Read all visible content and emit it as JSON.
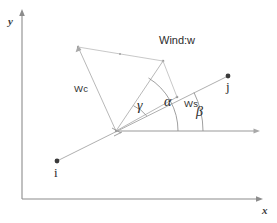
{
  "figure": {
    "kind": "vector-decomposition-diagram",
    "background_color": "#ffffff",
    "line_color": "#9a9a9a",
    "text_color": "#2b2b2b",
    "width": 277,
    "height": 223
  },
  "axes": {
    "y_label": "y",
    "x_label": "x",
    "origin_corner": {
      "x": 22,
      "y": 199
    },
    "y_axis_top": {
      "x": 22,
      "y": 12
    },
    "x_axis_right": {
      "x": 262,
      "y": 199
    }
  },
  "nodes": [
    {
      "name": "i",
      "label": "i",
      "x": 57,
      "y": 161,
      "label_x": 54,
      "label_y": 167
    },
    {
      "name": "j",
      "label": "j",
      "x": 228,
      "y": 76,
      "label_x": 226,
      "label_y": 82
    }
  ],
  "vectors": [
    {
      "name": "wind",
      "label": "Wind:w",
      "label_x": 159,
      "label_y": 40
    },
    {
      "name": "crosswind",
      "label": "Wc",
      "label_x": 77,
      "label_y": 86
    },
    {
      "name": "alongtrack",
      "label": "Ws",
      "label_x": 185,
      "label_y": 101
    }
  ],
  "angles": [
    {
      "name": "gamma",
      "symbol": "γ",
      "label_x": 139,
      "label_y": 104
    },
    {
      "name": "alpha",
      "symbol": "α",
      "label_x": 166,
      "label_y": 100
    },
    {
      "name": "beta",
      "symbol": "β",
      "label_x": 198,
      "label_y": 110
    }
  ],
  "geometry": {
    "origin": {
      "x": 116,
      "y": 131
    },
    "wind_tip": {
      "x": 163,
      "y": 61
    },
    "crosswind_tip": {
      "x": 78,
      "y": 47
    },
    "alongtrack_tip": {
      "x": 177,
      "y": 97
    },
    "track_from": {
      "x": 57,
      "y": 161
    },
    "track_to": {
      "x": 228,
      "y": 76
    },
    "horizontal_ref_to": {
      "x": 259,
      "y": 131
    }
  }
}
